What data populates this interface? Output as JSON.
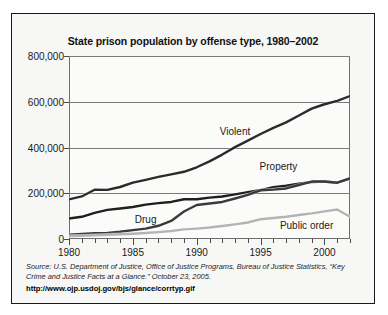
{
  "chart_data": {
    "type": "line",
    "title": "State prison population by offense type, 1980–2002",
    "xlabel": "",
    "ylabel": "",
    "xlim": [
      1980,
      2002
    ],
    "ylim": [
      0,
      800000
    ],
    "grid": true,
    "legend_position": "inline-annotations",
    "y_ticks": [
      0,
      200000,
      400000,
      600000,
      800000
    ],
    "y_tick_labels": [
      "0",
      "200,000",
      "400,000",
      "600,000",
      "800,000"
    ],
    "x_ticks": [
      1980,
      1981,
      1982,
      1983,
      1984,
      1985,
      1986,
      1987,
      1988,
      1989,
      1990,
      1991,
      1992,
      1993,
      1994,
      1995,
      1996,
      1997,
      1998,
      1999,
      2000,
      2001,
      2002
    ],
    "x_tick_labels_major": [
      "1980",
      "1985",
      "1990",
      "1995",
      "2000"
    ],
    "x_major_ticks": [
      1980,
      1985,
      1990,
      1995,
      2000
    ],
    "x": [
      1980,
      1981,
      1982,
      1983,
      1984,
      1985,
      1986,
      1987,
      1988,
      1989,
      1990,
      1991,
      1992,
      1993,
      1994,
      1995,
      1996,
      1997,
      1998,
      1999,
      2000,
      2001,
      2002
    ],
    "series": [
      {
        "name": "Violent",
        "color": "#2b2b2b",
        "values": [
          173300,
          186000,
          215300,
          214800,
          227300,
          246200,
          258600,
          271300,
          282700,
          293900,
          313600,
          339500,
          369100,
          401500,
          430000,
          459000,
          486000,
          510000,
          540000,
          570000,
          589100,
          604000,
          624900
        ]
      },
      {
        "name": "Property",
        "color": "#1f1f1f",
        "values": [
          89300,
          97000,
          114400,
          127100,
          133100,
          140100,
          150300,
          156800,
          162000,
          173700,
          173700,
          180700,
          186000,
          195000,
          205000,
          214000,
          227000,
          233000,
          242000,
          249000,
          251200,
          246000,
          265000
        ]
      },
      {
        "name": "Drug",
        "color": "#3a3a3a",
        "values": [
          19000,
          21700,
          25300,
          26600,
          31700,
          38900,
          45400,
          57900,
          79100,
          120100,
          148600,
          155200,
          162000,
          177000,
          193000,
          212800,
          216000,
          221000,
          236000,
          251200,
          251100,
          246000,
          265000
        ]
      },
      {
        "name": "Public order",
        "color": "#b4b4b4",
        "values": [
          12400,
          14000,
          16000,
          18000,
          21000,
          23000,
          26000,
          30000,
          35000,
          42000,
          45500,
          50000,
          57000,
          64000,
          72000,
          86500,
          92000,
          97000,
          105000,
          112000,
          120600,
          129000,
          97000
        ]
      }
    ],
    "annotations": [
      {
        "text": "Violent",
        "x": 1993.0,
        "y": 470000
      },
      {
        "text": "Property",
        "x": 1996.4,
        "y": 318000
      },
      {
        "text": "Drug",
        "x": 1986.0,
        "y": 88000
      },
      {
        "text": "Public order",
        "x": 1998.6,
        "y": 63000
      }
    ],
    "source_lead": "Source:",
    "source_text": " U.S. Department of Justice, Office of Justice Programs, Bureau of Justice Statistics, “Key Crime and Justice Facts at a Glance.” October 23, 2005.",
    "source_url": "http://www.ojp.usdoj.gov/bjs/glance/corrtyp.gif"
  }
}
